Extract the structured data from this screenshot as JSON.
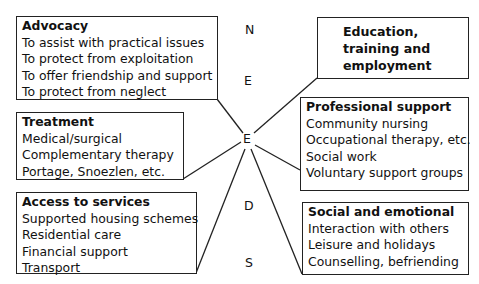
{
  "diagram": {
    "acronym_letters": [
      {
        "letter": "N"
      },
      {
        "letter": "E"
      },
      {
        "letter": "E"
      },
      {
        "letter": "D"
      },
      {
        "letter": "S"
      }
    ],
    "boxes": {
      "advocacy": {
        "title": "Advocacy",
        "items": [
          "To assist with practical issues",
          "To protect from exploitation",
          "To offer friendship and support",
          "To protect from neglect"
        ]
      },
      "education": {
        "title": "Education, training and employment",
        "items": []
      },
      "treatment": {
        "title": "Treatment",
        "items": [
          "Medical/surgical",
          "Complementary therapy",
          "Portage, Snoezlen, etc."
        ]
      },
      "professional": {
        "title": "Professional support",
        "items": [
          "Community nursing",
          "Occupational therapy, etc.",
          "Social work",
          "Voluntary support groups"
        ]
      },
      "access": {
        "title": "Access to services",
        "items": [
          "Supported housing schemes",
          "Residential care",
          "Financial support",
          "Transport"
        ]
      },
      "social": {
        "title": "Social and emotional",
        "items": [
          "Interaction with others",
          "Leisure and holidays",
          "Counselling, befriending"
        ]
      }
    },
    "colors": {
      "line": "#222222",
      "text": "#111111",
      "background": "#ffffff"
    }
  }
}
